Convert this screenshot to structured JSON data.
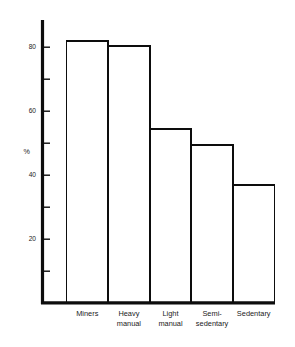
{
  "chart_data": {
    "type": "bar",
    "title": "",
    "xlabel": "",
    "ylabel": "%",
    "categories": [
      "Miners",
      "Heavy manual",
      "Light manual",
      "Semi-sedentary",
      "Sedentary"
    ],
    "category_lines": [
      [
        "Miners"
      ],
      [
        "Heavy",
        "manual"
      ],
      [
        "Light",
        "manual"
      ],
      [
        "Semi-",
        "sedentary"
      ],
      [
        "Sedentary"
      ]
    ],
    "values": [
      82,
      80.5,
      54.5,
      49.5,
      37
    ],
    "ylim": [
      0,
      90
    ],
    "ytick_labels": [
      "20",
      "40",
      "60",
      "80"
    ],
    "ytick_values": [
      20,
      40,
      60,
      80
    ],
    "minor_tick_values": [
      10,
      30,
      50,
      70,
      90
    ],
    "grid": false,
    "legend": "none",
    "bar_fill_color": "#ffffff",
    "bar_stroke_color": "#0d0d0d",
    "axis_color": "#0d0d0d",
    "background_color": "#ffffff"
  }
}
